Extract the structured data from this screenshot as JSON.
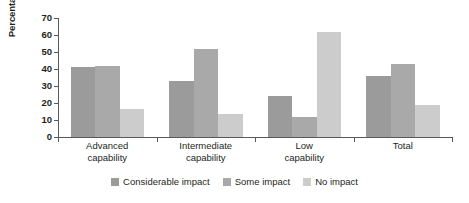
{
  "chart_data": {
    "type": "bar",
    "title": "",
    "xlabel": "",
    "ylabel": "Percentage",
    "ylim": [
      0,
      70
    ],
    "ytick_step": 10,
    "yticks": [
      0,
      10,
      20,
      30,
      40,
      50,
      60,
      70
    ],
    "grid": false,
    "legend_position": "bottom",
    "categories": [
      "Advanced capability",
      "Intermediate capability",
      "Low capability",
      "Total"
    ],
    "category_lines": [
      [
        "Advanced",
        "capability"
      ],
      [
        "Intermediate",
        "capability"
      ],
      [
        "Low",
        "capability"
      ],
      [
        "Total",
        ""
      ]
    ],
    "series": [
      {
        "name": "Considerable impact",
        "color": "#9b9b9b",
        "values": [
          41,
          33,
          24,
          36
        ]
      },
      {
        "name": "Some impact",
        "color": "#a9a9a9",
        "values": [
          41.5,
          52,
          11.5,
          43
        ]
      },
      {
        "name": "No impact",
        "color": "#cccccc",
        "values": [
          16.5,
          13.5,
          61.5,
          19
        ]
      }
    ]
  },
  "axis": {
    "y_title": "Percentage",
    "tick_labels": [
      "70",
      "60",
      "50",
      "40",
      "30",
      "20",
      "10",
      "0"
    ]
  },
  "legend": {
    "items": [
      {
        "label": "Considerable impact",
        "color": "#9b9b9b"
      },
      {
        "label": "Some impact",
        "color": "#a9a9a9"
      },
      {
        "label": "No impact",
        "color": "#cccccc"
      }
    ]
  }
}
